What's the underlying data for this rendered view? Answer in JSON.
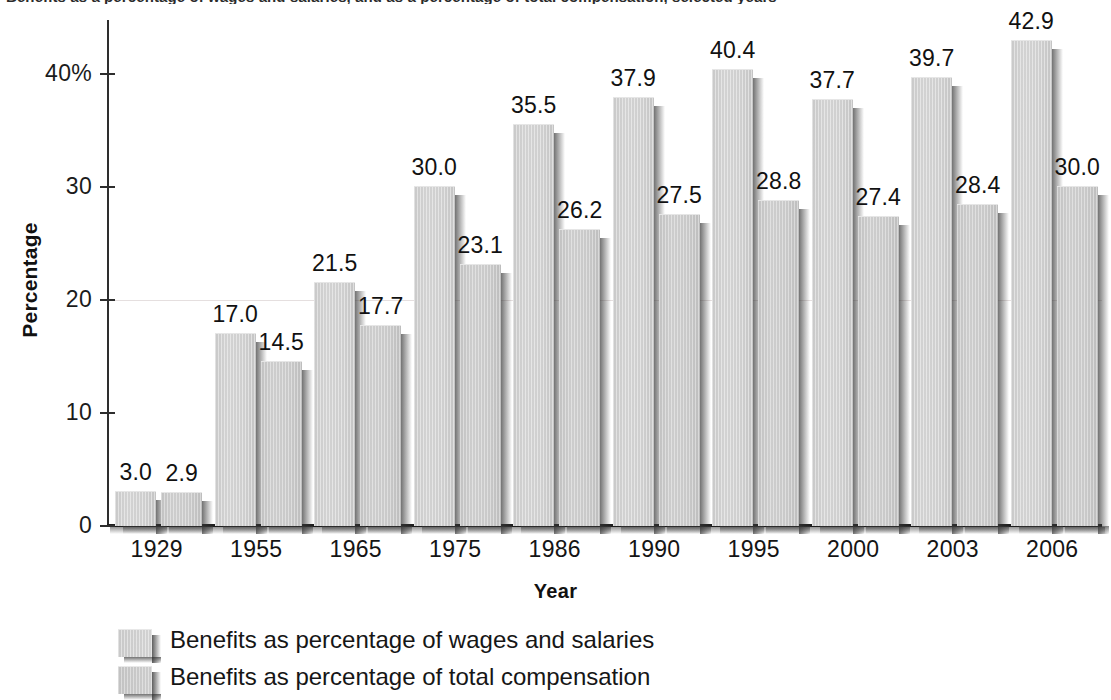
{
  "figure": {
    "cutoff_title": "Benefits as a percentage of wages and salaries, and as a percentage of total compensation, selected years"
  },
  "chart_data": {
    "type": "bar",
    "title": "",
    "xlabel": "Year",
    "ylabel": "Percentage",
    "categories": [
      "1929",
      "1955",
      "1965",
      "1975",
      "1986",
      "1990",
      "1995",
      "2000",
      "2003",
      "2006"
    ],
    "series": [
      {
        "name": "Benefits as percentage of wages and salaries",
        "values": [
          3.0,
          17.0,
          21.5,
          30.0,
          35.5,
          37.9,
          40.4,
          37.7,
          39.7,
          42.9
        ],
        "labels": [
          "3.0",
          "17.0",
          "21.5",
          "30.0",
          "35.5",
          "37.9",
          "40.4",
          "37.7",
          "39.7",
          "42.9"
        ],
        "color": "#cfcfcf"
      },
      {
        "name": "Benefits as percentage of total compensation",
        "values": [
          2.9,
          14.5,
          17.7,
          23.1,
          26.2,
          27.5,
          28.8,
          27.4,
          28.4,
          30.0
        ],
        "labels": [
          "2.9",
          "14.5",
          "17.7",
          "23.1",
          "26.2",
          "27.5",
          "28.8",
          "27.4",
          "28.4",
          "30.0"
        ],
        "color": "#c9c9c9"
      }
    ],
    "ylim": [
      0,
      44.8
    ],
    "yticks": [
      0,
      10,
      20,
      30,
      40
    ],
    "ytick_labels": [
      "0",
      "10",
      "20",
      "30",
      "40%"
    ],
    "grid": false,
    "legend_position": "bottom-left"
  }
}
